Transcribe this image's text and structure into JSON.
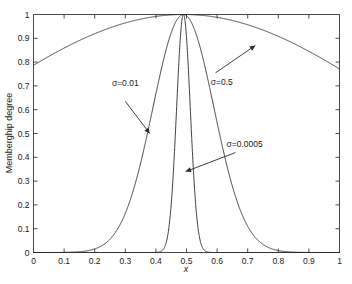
{
  "chart_data": {
    "type": "line",
    "title": "",
    "xlabel": "x",
    "ylabel": "Memberghip degree",
    "xlim": [
      0,
      1
    ],
    "ylim": [
      0,
      1
    ],
    "grid": false,
    "legend_position": "none",
    "x_ticks": [
      "0",
      "0.1",
      "0.2",
      "0.3",
      "0.4",
      "0.5",
      "0.6",
      "0.7",
      "0.8",
      "0.9",
      "1"
    ],
    "x_tick_values": [
      0,
      0.1,
      0.2,
      0.3,
      0.4,
      0.5,
      0.6,
      0.7,
      0.8,
      0.9,
      1
    ],
    "y_ticks": [
      "0",
      "0.1",
      "0.2",
      "0.3",
      "0.4",
      "0.5",
      "0.6",
      "0.7",
      "0.8",
      "0.9",
      "1"
    ],
    "y_tick_values": [
      0,
      0.1,
      0.2,
      0.3,
      0.4,
      0.5,
      0.6,
      0.7,
      0.8,
      0.9,
      1
    ],
    "center": 0.49,
    "series": [
      {
        "name": "sigma=0.5",
        "sigma": 0.5,
        "peak": 1.0,
        "value_at_x0": 0.61,
        "value_at_x1": 0.61,
        "x": [
          0,
          0.05,
          0.1,
          0.15,
          0.2,
          0.25,
          0.3,
          0.35,
          0.4,
          0.45,
          0.49,
          0.55,
          0.6,
          0.65,
          0.7,
          0.75,
          0.8,
          0.85,
          0.9,
          0.95,
          1
        ],
        "values": [
          0.61,
          0.661,
          0.711,
          0.758,
          0.803,
          0.844,
          0.882,
          0.915,
          0.944,
          0.968,
          1.0,
          0.993,
          0.98,
          0.958,
          0.93,
          0.896,
          0.856,
          0.811,
          0.762,
          0.71,
          0.61
        ]
      },
      {
        "name": "sigma=0.01",
        "sigma": 0.01,
        "peak": 1.0,
        "visible_span": [
          0.28,
          0.7
        ],
        "x": [
          0.28,
          0.3,
          0.32,
          0.34,
          0.36,
          0.38,
          0.4,
          0.42,
          0.44,
          0.46,
          0.49,
          0.52,
          0.54,
          0.56,
          0.58,
          0.6,
          0.62,
          0.64,
          0.66,
          0.68,
          0.7
        ],
        "values": [
          0.01,
          0.023,
          0.05,
          0.099,
          0.18,
          0.297,
          0.442,
          0.595,
          0.735,
          0.871,
          1.0,
          0.871,
          0.735,
          0.595,
          0.442,
          0.297,
          0.18,
          0.099,
          0.05,
          0.023,
          0.01
        ]
      },
      {
        "name": "sigma=0.0005",
        "sigma": 0.0005,
        "peak": 1.0,
        "visible_span": [
          0.455,
          0.535
        ],
        "x": [
          0.455,
          0.46,
          0.465,
          0.47,
          0.474,
          0.478,
          0.482,
          0.486,
          0.49,
          0.494,
          0.498,
          0.502,
          0.506,
          0.51,
          0.515,
          0.52,
          0.525,
          0.53,
          0.535
        ],
        "values": [
          0.01,
          0.025,
          0.06,
          0.14,
          0.25,
          0.42,
          0.62,
          0.84,
          1.0,
          0.84,
          0.62,
          0.42,
          0.25,
          0.14,
          0.06,
          0.035,
          0.02,
          0.013,
          0.008
        ]
      }
    ],
    "annotations": [
      {
        "label": "σ=0.5",
        "text_x": 0.615,
        "text_y": 0.705,
        "arrow_from": [
          0.595,
          0.755
        ],
        "arrow_to": [
          0.725,
          0.87
        ]
      },
      {
        "label": "σ=0.01",
        "text_x": 0.3,
        "text_y": 0.7,
        "arrow_from": [
          0.3,
          0.635
        ],
        "arrow_to": [
          0.38,
          0.5
        ]
      },
      {
        "label": "σ=0.0005",
        "text_x": 0.69,
        "text_y": 0.445,
        "arrow_from": [
          0.66,
          0.42
        ],
        "arrow_to": [
          0.497,
          0.34
        ]
      }
    ]
  }
}
